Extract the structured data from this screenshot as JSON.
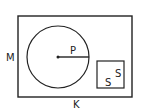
{
  "diagram": {
    "outer_rect": {
      "x": 18,
      "y": 16,
      "w": 114,
      "h": 81,
      "label_side": "M",
      "label_bottom": "K"
    },
    "circle": {
      "cx": 58,
      "cy": 57,
      "r": 31,
      "radius_label": "P"
    },
    "square": {
      "x": 97,
      "y": 61,
      "w": 27,
      "h": 27,
      "side_label_1": "S",
      "side_label_2": "S"
    },
    "stroke_color": "#222222",
    "background": "#ffffff"
  }
}
